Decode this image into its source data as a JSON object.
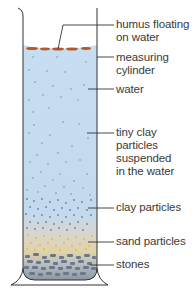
{
  "diagram": {
    "colors": {
      "water": "#c5dcf1",
      "water_edge": "#a9c8e6",
      "humus": "#b4582a",
      "clay_dot": "#7a8aa6",
      "sand": "#e3cf9c",
      "stones": "#7f8a98",
      "line": "#333333"
    },
    "labels": [
      {
        "id": "humus",
        "lines": [
          "humus floating",
          "on water"
        ]
      },
      {
        "id": "cylinder",
        "lines": [
          "measuring",
          "cylinder"
        ]
      },
      {
        "id": "water",
        "lines": [
          "water"
        ]
      },
      {
        "id": "tiny-clay",
        "lines": [
          "tiny clay",
          "particles",
          "suspended",
          "in the water"
        ]
      },
      {
        "id": "clay",
        "lines": [
          "clay particles"
        ]
      },
      {
        "id": "sand",
        "lines": [
          "sand particles"
        ]
      },
      {
        "id": "stones",
        "lines": [
          "stones"
        ]
      }
    ]
  }
}
